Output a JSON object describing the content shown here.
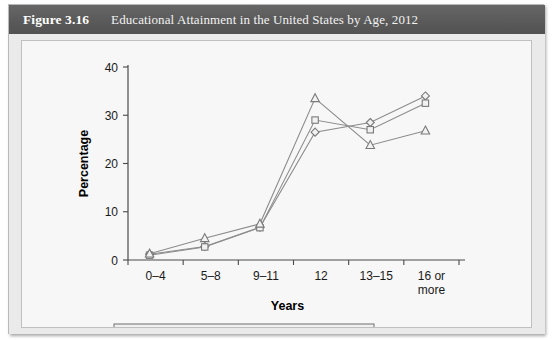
{
  "figure": {
    "number_label": "Figure 3.16",
    "title": "Educational Attainment in the United States by Age, 2012"
  },
  "colors": {
    "title_bar": "#5d5d5d",
    "page_background": "#eaeaea",
    "panel_background": "#f7f7f7",
    "panel_border": "#c0c0c0",
    "line": "#8c8c8c",
    "marker_fill": "#f2f2f2",
    "marker_stroke": "#7a7a7a",
    "axis": "#4a4a4a",
    "text": "#1a1a1a"
  },
  "chart_data": {
    "type": "line",
    "title": "Educational Attainment in the United States by Age, 2012",
    "subtitle": "",
    "xlabel": "Years",
    "ylabel": "Percentage",
    "categories": [
      "0–4",
      "5–8",
      "9–11",
      "12",
      "13–15",
      "16 or more"
    ],
    "category_lines": [
      [
        "0–4"
      ],
      [
        "5–8"
      ],
      [
        "9–11"
      ],
      [
        "12"
      ],
      [
        "13–15"
      ],
      [
        "16 or",
        "more"
      ]
    ],
    "ylim": [
      0,
      40
    ],
    "yticks": [
      0,
      10,
      20,
      30,
      40
    ],
    "ytick_labels": [
      "0",
      "10",
      "20",
      "30",
      "40"
    ],
    "grid": false,
    "legend_position": "bottom",
    "series": [
      {
        "name": "25 to 34 years",
        "marker": "diamond",
        "values": [
          1.2,
          2.8,
          6.8,
          26.5,
          28.5,
          34.0
        ]
      },
      {
        "name": "35 to 54 years",
        "marker": "square",
        "values": [
          1.0,
          2.7,
          6.7,
          29.0,
          27.0,
          32.5
        ]
      },
      {
        "name": "55 years or older",
        "marker": "triangle",
        "values": [
          1.3,
          4.5,
          7.5,
          33.5,
          23.8,
          26.8
        ]
      }
    ]
  }
}
